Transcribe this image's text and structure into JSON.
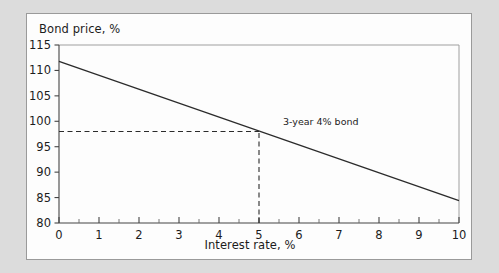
{
  "figure": {
    "background_color": "#dcdcdc",
    "panel_color": "#fdfdfd",
    "border_color": "#9a9a9a",
    "line_color": "#2b2b2b"
  },
  "chart_data": {
    "type": "line",
    "title": "",
    "xlabel": "Interest rate, %",
    "ylabel": "Bond price, %",
    "xlim": [
      0,
      10
    ],
    "ylim": [
      80,
      115
    ],
    "xticks": [
      0,
      1,
      2,
      3,
      4,
      5,
      6,
      7,
      8,
      9,
      10
    ],
    "xtick_labels": [
      "0",
      "1",
      "2",
      "3",
      "4",
      "5",
      "6",
      "7",
      "8",
      "9",
      "10"
    ],
    "xminor_step": 0.5,
    "yticks": [
      80,
      85,
      90,
      95,
      100,
      105,
      110,
      115
    ],
    "ytick_labels": [
      "80",
      "85",
      "90",
      "95",
      "100",
      "105",
      "110",
      "115"
    ],
    "grid": false,
    "legend": null,
    "series": [
      {
        "name": "3-year 4% bond",
        "x": [
          0,
          10
        ],
        "values": [
          111.8,
          84.4
        ],
        "style": "solid",
        "color": "#2b2b2b"
      }
    ],
    "annotations": [
      {
        "name": "series-label",
        "text": "3-year 4% bond",
        "x": 5.6,
        "y": 99.2
      }
    ],
    "guides": [
      {
        "name": "price-guide-horizontal",
        "orientation": "horizontal",
        "y": 98,
        "x_from": 0,
        "x_to": 5,
        "style": "dashed"
      },
      {
        "name": "rate-guide-vertical",
        "orientation": "vertical",
        "x": 5,
        "y_from": 80,
        "y_to": 98,
        "style": "dashed"
      }
    ]
  }
}
